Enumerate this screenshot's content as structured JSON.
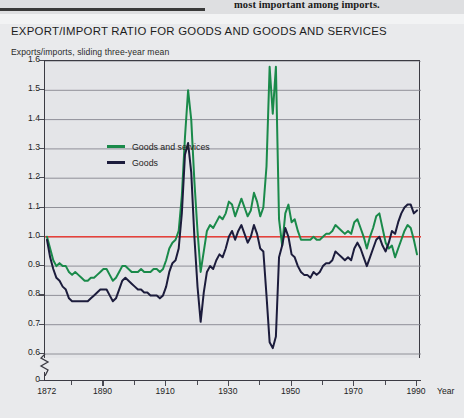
{
  "page": {
    "above_fragment": "most important among imports.",
    "background_color": "#e9eaec"
  },
  "chart_title": "EXPORT/IMPORT RATIO FOR GOODS AND GOODS AND SERVICES",
  "axis_note": "Exports/imports, sliding three-year mean",
  "year_axis_label": "Year",
  "legend": {
    "items": [
      {
        "label": "Goods and services",
        "color": "#1a8a4a"
      },
      {
        "label": "Goods",
        "color": "#1c1c3c"
      }
    ]
  },
  "colors": {
    "goods_and_services": "#1a8a4a",
    "goods": "#1c1c3c",
    "reference_line": "#e8403a",
    "gridline": "#86868e",
    "axis": "#3b3b43",
    "plot_background": "#e4e5e8"
  },
  "chart_data": {
    "type": "line",
    "title": "EXPORT/IMPORT RATIO FOR GOODS AND GOODS AND SERVICES",
    "subtitle": "Exports/imports, sliding three-year mean",
    "xlabel": "Year",
    "ylabel": "Exports/imports, sliding three-year mean",
    "xlim": [
      1872,
      1990
    ],
    "ylim": [
      0.55,
      1.6
    ],
    "y_axis_broken_at_zero": true,
    "grid": true,
    "legend_position": "top-left inside plot",
    "reference_line": {
      "value": 1.0,
      "color": "#e8403a",
      "label": "ratio = 1.0"
    },
    "ytick_labels": [
      "1.6",
      "1.5",
      "1.4",
      "1.3",
      "1.2",
      "1.1",
      "1.0",
      "0.9",
      "0.8",
      "0.7",
      "0.6",
      "0"
    ],
    "ytick_values": [
      1.6,
      1.5,
      1.4,
      1.3,
      1.2,
      1.1,
      1.0,
      0.9,
      0.8,
      0.7,
      0.6,
      0
    ],
    "xtick_labels": [
      "1872",
      "1890",
      "1910",
      "1930",
      "1950",
      "1970",
      "1990"
    ],
    "xtick_values": [
      1872,
      1890,
      1910,
      1930,
      1950,
      1970,
      1990
    ],
    "x": [
      1872,
      1873,
      1874,
      1875,
      1876,
      1877,
      1878,
      1879,
      1880,
      1881,
      1882,
      1883,
      1884,
      1885,
      1886,
      1887,
      1888,
      1889,
      1890,
      1891,
      1892,
      1893,
      1894,
      1895,
      1896,
      1897,
      1898,
      1899,
      1900,
      1901,
      1902,
      1903,
      1904,
      1905,
      1906,
      1907,
      1908,
      1909,
      1910,
      1911,
      1912,
      1913,
      1914,
      1915,
      1916,
      1917,
      1918,
      1919,
      1920,
      1921,
      1922,
      1923,
      1924,
      1925,
      1926,
      1927,
      1928,
      1929,
      1930,
      1931,
      1932,
      1933,
      1934,
      1935,
      1936,
      1937,
      1938,
      1939,
      1940,
      1941,
      1942,
      1943,
      1944,
      1945,
      1946,
      1947,
      1948,
      1949,
      1950,
      1951,
      1952,
      1953,
      1954,
      1955,
      1956,
      1957,
      1958,
      1959,
      1960,
      1961,
      1962,
      1963,
      1964,
      1965,
      1966,
      1967,
      1968,
      1969,
      1970,
      1971,
      1972,
      1973,
      1974,
      1975,
      1976,
      1977,
      1978,
      1979,
      1980,
      1981,
      1982,
      1983,
      1984,
      1985,
      1986,
      1987,
      1988,
      1989,
      1990
    ],
    "series": [
      {
        "name": "Goods and services",
        "color": "#1a8a4a",
        "values": [
          1.0,
          0.96,
          0.92,
          0.9,
          0.91,
          0.9,
          0.9,
          0.88,
          0.87,
          0.88,
          0.87,
          0.86,
          0.85,
          0.85,
          0.86,
          0.86,
          0.87,
          0.88,
          0.89,
          0.89,
          0.87,
          0.85,
          0.86,
          0.88,
          0.9,
          0.9,
          0.89,
          0.88,
          0.88,
          0.88,
          0.89,
          0.88,
          0.88,
          0.88,
          0.89,
          0.89,
          0.88,
          0.89,
          0.92,
          0.96,
          0.98,
          0.99,
          1.02,
          1.14,
          1.34,
          1.5,
          1.4,
          1.19,
          1.02,
          0.88,
          0.95,
          1.02,
          1.04,
          1.03,
          1.05,
          1.07,
          1.06,
          1.08,
          1.12,
          1.11,
          1.07,
          1.1,
          1.13,
          1.1,
          1.07,
          1.09,
          1.15,
          1.12,
          1.07,
          1.1,
          1.24,
          1.58,
          1.42,
          1.58,
          1.06,
          0.97,
          1.08,
          1.11,
          1.05,
          1.06,
          1.02,
          0.99,
          0.99,
          0.99,
          0.99,
          1.0,
          0.99,
          0.99,
          1.0,
          1.01,
          1.01,
          1.02,
          1.04,
          1.03,
          1.02,
          1.01,
          1.02,
          1.01,
          1.05,
          1.06,
          1.03,
          1.0,
          0.96,
          1.0,
          1.03,
          1.07,
          1.08,
          1.03,
          0.98,
          0.96,
          0.97,
          0.93,
          0.96,
          0.99,
          1.02,
          1.04,
          1.03,
          0.99,
          0.94
        ]
      },
      {
        "name": "Goods",
        "color": "#1c1c3c",
        "values": [
          0.99,
          0.93,
          0.89,
          0.86,
          0.85,
          0.83,
          0.82,
          0.79,
          0.78,
          0.78,
          0.78,
          0.78,
          0.78,
          0.78,
          0.79,
          0.8,
          0.81,
          0.82,
          0.82,
          0.82,
          0.8,
          0.78,
          0.79,
          0.82,
          0.85,
          0.86,
          0.85,
          0.84,
          0.83,
          0.82,
          0.82,
          0.81,
          0.81,
          0.8,
          0.8,
          0.8,
          0.79,
          0.8,
          0.83,
          0.88,
          0.91,
          0.92,
          0.96,
          1.08,
          1.28,
          1.32,
          1.22,
          1.0,
          0.83,
          0.71,
          0.81,
          0.88,
          0.9,
          0.89,
          0.92,
          0.94,
          0.93,
          0.96,
          1.0,
          1.02,
          0.99,
          1.02,
          1.04,
          1.01,
          0.98,
          1.0,
          1.04,
          1.01,
          0.96,
          0.95,
          0.8,
          0.64,
          0.62,
          0.66,
          0.93,
          0.97,
          1.03,
          1.0,
          0.94,
          0.93,
          0.9,
          0.88,
          0.87,
          0.87,
          0.86,
          0.88,
          0.87,
          0.88,
          0.9,
          0.91,
          0.91,
          0.92,
          0.95,
          0.94,
          0.93,
          0.92,
          0.93,
          0.92,
          0.96,
          0.98,
          0.96,
          0.93,
          0.9,
          0.93,
          0.96,
          0.99,
          1.0,
          0.97,
          0.95,
          0.98,
          1.02,
          1.01,
          1.05,
          1.08,
          1.1,
          1.11,
          1.11,
          1.08,
          1.09
        ]
      }
    ]
  }
}
